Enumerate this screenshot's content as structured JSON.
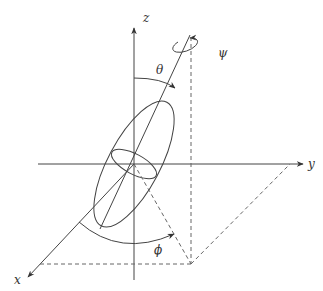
{
  "diagram": {
    "axes": {
      "x_label": "x",
      "y_label": "y",
      "z_label": "z"
    },
    "angles": {
      "theta": "θ",
      "phi": "ϕ",
      "psi": "ψ"
    },
    "colors": {
      "line": "#444444",
      "dashed": "#666666",
      "background": "#ffffff"
    }
  }
}
